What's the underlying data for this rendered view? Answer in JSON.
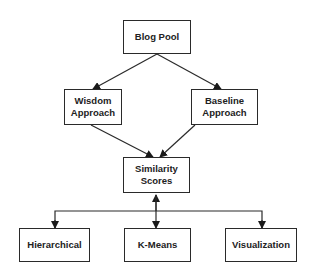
{
  "diagram": {
    "nodes": {
      "blog_pool": "Blog Pool",
      "wisdom": "Wisdom\nApproach",
      "baseline": "Baseline\nApproach",
      "similarity": "Similarity\nScores",
      "hierarchical": "Hierarchical",
      "kmeans": "K-Means",
      "visualization": "Visualization"
    },
    "edges": [
      {
        "from": "Blog Pool",
        "to": "Wisdom Approach"
      },
      {
        "from": "Blog Pool",
        "to": "Baseline Approach"
      },
      {
        "from": "Wisdom Approach",
        "to": "Similarity Scores"
      },
      {
        "from": "Baseline Approach",
        "to": "Similarity Scores"
      },
      {
        "from": "Similarity Scores",
        "to": "Hierarchical"
      },
      {
        "from": "Similarity Scores",
        "to": "K-Means"
      },
      {
        "from": "Similarity Scores",
        "to": "Visualization"
      }
    ],
    "colors": {
      "stroke": "#2a2a2a",
      "fill": "#ffffff",
      "text": "#222222"
    }
  }
}
